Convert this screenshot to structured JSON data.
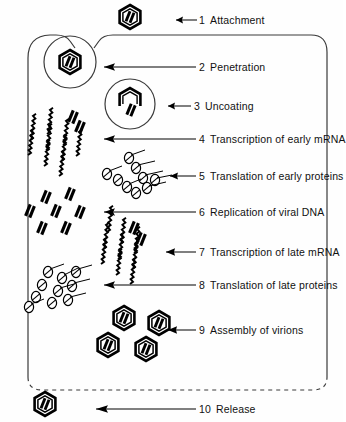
{
  "figure": {
    "colors": {
      "ink": "#000000",
      "background": "#ffffff",
      "cell_outline": "#3a3a3a"
    },
    "cell": {
      "name": "host-cell",
      "membrane_style_top": "solid",
      "membrane_style_bottom": "dashed"
    }
  },
  "steps": [
    {
      "number": "1",
      "label": "Attachment"
    },
    {
      "number": "2",
      "label": "Penetration"
    },
    {
      "number": "3",
      "label": "Uncoating"
    },
    {
      "number": "4",
      "label": "Transcription of early mRNA"
    },
    {
      "number": "5",
      "label": "Translation of early proteins"
    },
    {
      "number": "6",
      "label": "Replication of viral DNA"
    },
    {
      "number": "7",
      "label": "Transcription of late mRNA"
    },
    {
      "number": "8",
      "label": "Translation of late proteins"
    },
    {
      "number": "9",
      "label": "Assembly of virions"
    },
    {
      "number": "10",
      "label": "Release"
    }
  ],
  "icons": {
    "virion": "hexagon-with-double-bar-icon",
    "capsid_open": "open-capsid-icon",
    "dna": "double-bar-dna-icon",
    "mrna": "zigzag-mrna-icon",
    "polyribosome": "polyribosome-protein-icon",
    "arrow": "left-arrow-icon",
    "vesicle": "endocytic-vesicle-icon"
  }
}
